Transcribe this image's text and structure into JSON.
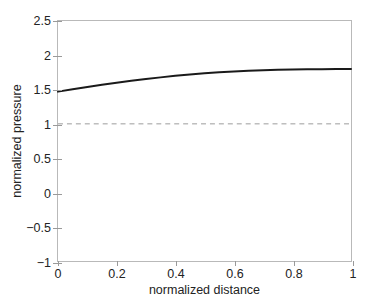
{
  "chart_data": {
    "type": "line",
    "title": "",
    "xlabel": "normalized distance",
    "ylabel": "normalized pressure",
    "xlim": [
      0,
      1
    ],
    "ylim": [
      -1,
      2.5
    ],
    "grid": false,
    "legend": null,
    "xticks": [
      0,
      0.2,
      0.4,
      0.6,
      0.8,
      1
    ],
    "xticklabels": [
      "0",
      "0.2",
      "0.4",
      "0.6",
      "0.8",
      "1"
    ],
    "yticks": [
      -1,
      -0.5,
      0,
      0.5,
      1,
      1.5,
      2,
      2.5
    ],
    "yticklabels": [
      "−1",
      "−0.5",
      "0",
      "0.5",
      "1",
      "1.5",
      "2",
      "2.5"
    ],
    "series": [
      {
        "name": "normalized pressure",
        "style": "solid",
        "color": "#1a1a1a",
        "x": [
          0.0,
          0.05,
          0.1,
          0.15,
          0.2,
          0.25,
          0.3,
          0.35,
          0.4,
          0.45,
          0.5,
          0.55,
          0.6,
          0.65,
          0.7,
          0.75,
          0.8,
          0.85,
          0.9,
          0.95,
          1.0
        ],
        "values": [
          1.47,
          1.505,
          1.538,
          1.57,
          1.6,
          1.628,
          1.654,
          1.678,
          1.7,
          1.72,
          1.738,
          1.752,
          1.764,
          1.774,
          1.782,
          1.788,
          1.792,
          1.795,
          1.797,
          1.799,
          1.8
        ]
      },
      {
        "name": "reference",
        "style": "dashed",
        "color": "#9c9c9c",
        "x": [
          0,
          1
        ],
        "values": [
          1,
          1
        ]
      }
    ]
  },
  "axis": {
    "x_title": "normalized distance",
    "y_title": "normalized pressure"
  },
  "colors": {
    "curve": "#1a1a1a",
    "reference": "#9c9c9c",
    "axis": "#b9b9b9",
    "text": "#232323",
    "background": "#ffffff"
  }
}
